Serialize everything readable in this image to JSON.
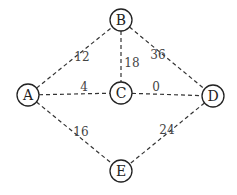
{
  "nodes": [
    {
      "id": "A",
      "label": "A",
      "x": 28,
      "y": 95
    },
    {
      "id": "B",
      "label": "B",
      "x": 121,
      "y": 20
    },
    {
      "id": "C",
      "label": "C",
      "x": 121,
      "y": 93
    },
    {
      "id": "D",
      "label": "D",
      "x": 213,
      "y": 96
    },
    {
      "id": "E",
      "label": "E",
      "x": 121,
      "y": 171
    }
  ],
  "edges": [
    {
      "from": "A",
      "to": "B",
      "weight": "12",
      "lx": 82,
      "ly": 61
    },
    {
      "from": "B",
      "to": "C",
      "weight": "18",
      "lx": 132,
      "ly": 67
    },
    {
      "from": "B",
      "to": "D",
      "weight": "36",
      "lx": 158,
      "ly": 59
    },
    {
      "from": "A",
      "to": "C",
      "weight": "4",
      "lx": 84,
      "ly": 91
    },
    {
      "from": "C",
      "to": "D",
      "weight": "0",
      "lx": 156,
      "ly": 91
    },
    {
      "from": "A",
      "to": "E",
      "weight": "16",
      "lx": 81,
      "ly": 136
    },
    {
      "from": "D",
      "to": "E",
      "weight": "24",
      "lx": 167,
      "ly": 134
    }
  ]
}
